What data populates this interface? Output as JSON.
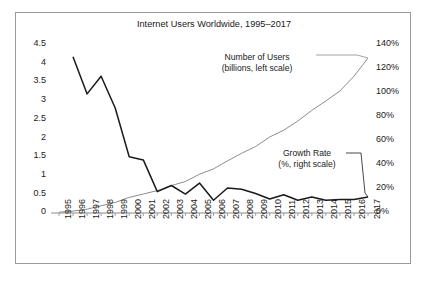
{
  "chart_data": {
    "type": "line",
    "title": "Internet Users Worldwide, 1995–2017",
    "xlabel": "",
    "ylabel": "",
    "grid": false,
    "legend_position": "inline-annotations",
    "x": [
      "1995",
      "1996",
      "1997",
      "1998",
      "1999",
      "2000",
      "2001",
      "2002",
      "2003",
      "2004",
      "2005",
      "2006",
      "2007",
      "2008",
      "2009",
      "2010",
      "2011",
      "2012",
      "2013",
      "2014",
      "2015",
      "2016",
      "2017"
    ],
    "y_left": {
      "label": "Number of Users (billions, left scale)",
      "ticks": [
        "0",
        "0.5",
        "1",
        "1.5",
        "2",
        "2.5",
        "3",
        "3.5",
        "4",
        "4.5"
      ],
      "tick_values": [
        0,
        0.5,
        1,
        1.5,
        2,
        2.5,
        3,
        3.5,
        4,
        4.5
      ],
      "ylim": [
        0,
        4.5
      ]
    },
    "y_right": {
      "label": "Growth Rate (%, right scale)",
      "ticks": [
        "0%",
        "20%",
        "40%",
        "60%",
        "80%",
        "100%",
        "120%",
        "140%"
      ],
      "tick_values": [
        0,
        20,
        40,
        60,
        80,
        100,
        120,
        140
      ],
      "ylim": [
        0,
        140
      ]
    },
    "series": [
      {
        "name": "Number of Users",
        "axis": "left",
        "units": "billions",
        "color": "#8c8c8c",
        "style": "thin-smooth",
        "values": [
          0.02,
          0.05,
          0.1,
          0.19,
          0.28,
          0.41,
          0.5,
          0.59,
          0.72,
          0.83,
          1.02,
          1.16,
          1.37,
          1.57,
          1.75,
          2.0,
          2.18,
          2.42,
          2.7,
          2.95,
          3.21,
          3.6,
          4.08
        ]
      },
      {
        "name": "Growth Rate",
        "axis": "right",
        "units": "percent",
        "color": "#1a1a1a",
        "style": "bold-jagged",
        "values": [
          null,
          128.0,
          97.5,
          112.0,
          86.0,
          46.0,
          43.5,
          17.5,
          22.5,
          15.5,
          24.5,
          10.5,
          20.5,
          19.5,
          16.0,
          11.5,
          15.0,
          10.5,
          13.0,
          10.5,
          11.0,
          11.0,
          13.0
        ]
      }
    ],
    "annotations": [
      {
        "name": "users-callout",
        "line1": "Number of Users",
        "line2": "(billions, left scale)"
      },
      {
        "name": "growth-callout",
        "line1": "Growth Rate",
        "line2": "(%, right scale)"
      }
    ]
  }
}
